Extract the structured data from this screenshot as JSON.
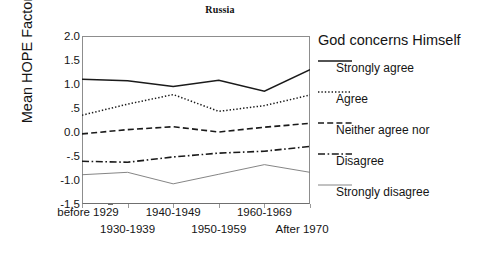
{
  "chart_data": {
    "type": "line",
    "title": "Russia",
    "xlabel": "",
    "ylabel": "Mean HOPE Factor",
    "categories": [
      "before 1929",
      "1930-1939",
      "1940-1949",
      "1950-1959",
      "1960-1969",
      "After 1970"
    ],
    "ylim": [
      -1.5,
      2.0
    ],
    "yticks": [
      "2.0",
      "1.5",
      "1.0",
      ".5",
      "0.0",
      "-.5",
      "-1.0",
      "-1.5"
    ],
    "ytick_values": [
      2.0,
      1.5,
      1.0,
      0.5,
      0.0,
      -0.5,
      -1.0,
      -1.5
    ],
    "grid": false,
    "legend_position": "right",
    "legend_title": "God concerns Himself",
    "series": [
      {
        "name": "Strongly agree",
        "style": "solid",
        "values": [
          1.1,
          1.07,
          0.95,
          1.08,
          0.85,
          1.3
        ]
      },
      {
        "name": "Agree",
        "style": "dotted",
        "values": [
          0.35,
          0.58,
          0.78,
          0.43,
          0.55,
          0.77
        ]
      },
      {
        "name": "Neither agree nor",
        "style": "dashed",
        "values": [
          -0.04,
          0.05,
          0.11,
          0.0,
          0.1,
          0.18
        ]
      },
      {
        "name": "Disagree",
        "style": "dash-dot",
        "values": [
          -0.61,
          -0.63,
          -0.52,
          -0.44,
          -0.4,
          -0.3
        ]
      },
      {
        "name": "Strongly disagree",
        "style": "thin-solid",
        "values": [
          -0.89,
          -0.84,
          -1.08,
          -0.88,
          -0.68,
          -0.84
        ]
      }
    ]
  },
  "colors": {
    "line": "#1a1a1a",
    "thin_line": "#777777",
    "frame": "#8d8d8d",
    "text": "#141414",
    "background": "#ffffff"
  }
}
